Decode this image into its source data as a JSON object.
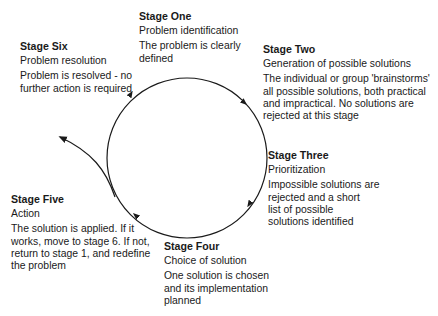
{
  "diagram": {
    "type": "cycle",
    "stages": [
      {
        "key": "one",
        "title": "Stage One",
        "subtitle": "Problem identification",
        "description": "The problem is clearly\ndefined"
      },
      {
        "key": "two",
        "title": "Stage Two",
        "subtitle": "Generation of possible solutions",
        "description": "The individual or group 'brainstorms'\nall possible solutions, both practical\nand impractical.  No solutions are\nrejected at this stage"
      },
      {
        "key": "three",
        "title": "Stage Three",
        "subtitle": "Prioritization",
        "description": "Impossible solutions are\nrejected and a short\nlist of possible\nsolutions identified"
      },
      {
        "key": "four",
        "title": "Stage Four",
        "subtitle": "Choice of solution",
        "description": "One solution is chosen\nand its implementation\nplanned"
      },
      {
        "key": "five",
        "title": "Stage Five",
        "subtitle": "Action",
        "description": "The solution is applied.  If it\nworks, move to stage 6.  If not,\nreturn to stage 1, and redefine\nthe problem"
      },
      {
        "key": "six",
        "title": "Stage Six",
        "subtitle": "Problem resolution",
        "description": "Problem is resolved - no\nfurther action is required"
      }
    ],
    "colors": {
      "line": "#1a1a1a",
      "text": "#1a1a1a",
      "background": "#ffffff"
    }
  }
}
